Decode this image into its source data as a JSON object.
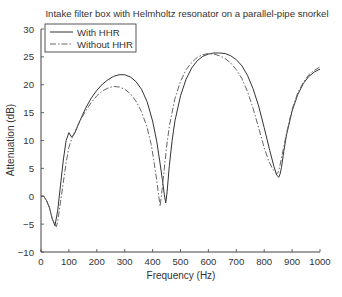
{
  "chart_data": {
    "type": "line",
    "title": "Intake filter box with Helmholtz resonator on a parallel-pipe snorkel",
    "xlabel": "Frequency (Hz)",
    "ylabel": "Attenuation (dB)",
    "xlim": [
      0,
      1000
    ],
    "ylim": [
      -10,
      30
    ],
    "xticks": [
      0,
      100,
      200,
      300,
      400,
      500,
      600,
      700,
      800,
      900,
      1000
    ],
    "yticks": [
      -10,
      -5,
      0,
      5,
      10,
      15,
      20,
      25,
      30
    ],
    "grid": false,
    "legend_position": "top-left",
    "series": [
      {
        "name": "With HHR",
        "style": "solid",
        "color": "#333333",
        "x": [
          0,
          10,
          20,
          30,
          40,
          50,
          60,
          70,
          80,
          90,
          100,
          110,
          120,
          140,
          160,
          180,
          200,
          220,
          240,
          260,
          280,
          300,
          320,
          340,
          360,
          380,
          400,
          415,
          425,
          435,
          442,
          447,
          452,
          460,
          470,
          480,
          500,
          520,
          540,
          560,
          580,
          600,
          620,
          640,
          660,
          680,
          700,
          720,
          740,
          760,
          780,
          800,
          820,
          835,
          845,
          852,
          857,
          862,
          870,
          880,
          900,
          920,
          940,
          960,
          980,
          1000
        ],
        "y": [
          0,
          0,
          -0.8,
          -2.0,
          -4.0,
          -5.3,
          -2.5,
          2.0,
          6.5,
          10.0,
          11.4,
          10.6,
          11.2,
          13.6,
          15.8,
          17.6,
          19.0,
          20.1,
          20.9,
          21.5,
          21.8,
          21.8,
          21.4,
          20.6,
          19.2,
          17.0,
          13.5,
          9.8,
          6.5,
          3.0,
          0.3,
          -1.2,
          0.8,
          5.5,
          10.0,
          13.5,
          18.0,
          21.0,
          23.0,
          24.3,
          25.1,
          25.5,
          25.7,
          25.7,
          25.6,
          25.2,
          24.5,
          23.4,
          21.7,
          19.3,
          16.2,
          12.3,
          8.2,
          5.3,
          3.8,
          3.4,
          4.0,
          5.2,
          8.0,
          11.0,
          15.3,
          18.2,
          20.2,
          21.5,
          22.3,
          22.8
        ]
      },
      {
        "name": "Without HHR",
        "style": "dash-dot",
        "color": "#666666",
        "x": [
          0,
          10,
          20,
          30,
          40,
          50,
          55,
          60,
          70,
          80,
          90,
          100,
          110,
          120,
          140,
          160,
          180,
          200,
          220,
          240,
          260,
          280,
          300,
          320,
          340,
          360,
          380,
          395,
          405,
          415,
          422,
          427,
          432,
          440,
          450,
          460,
          480,
          500,
          520,
          540,
          560,
          580,
          600,
          620,
          640,
          660,
          680,
          700,
          720,
          740,
          760,
          780,
          800,
          815,
          828,
          838,
          845,
          850,
          856,
          865,
          880,
          900,
          920,
          940,
          960,
          980,
          1000
        ],
        "y": [
          0,
          0,
          -0.8,
          -2.0,
          -4.0,
          -5.0,
          -5.5,
          -4.5,
          -1.0,
          2.5,
          6.0,
          8.8,
          10.3,
          11.5,
          13.5,
          15.3,
          16.8,
          18.0,
          18.9,
          19.4,
          19.7,
          19.6,
          19.2,
          18.4,
          17.1,
          15.2,
          12.4,
          9.3,
          6.2,
          2.8,
          0.0,
          -1.8,
          0.3,
          4.0,
          8.8,
          12.6,
          17.5,
          20.6,
          22.7,
          24.0,
          24.9,
          25.4,
          25.6,
          25.5,
          25.2,
          24.7,
          23.9,
          22.7,
          21.1,
          18.8,
          15.8,
          12.3,
          8.7,
          6.5,
          5.1,
          4.3,
          4.0,
          4.3,
          5.4,
          7.6,
          11.3,
          15.6,
          18.5,
          20.4,
          21.8,
          22.6,
          23.2
        ]
      }
    ]
  }
}
